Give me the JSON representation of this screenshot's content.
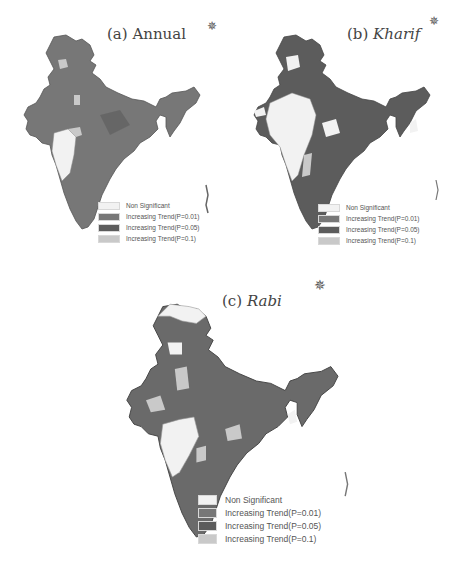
{
  "colors": {
    "non_significant": "#f2f2f2",
    "p001": "#777777",
    "p005": "#5c5c5c",
    "p01": "#c9c9c9",
    "border": "#4a4a4a"
  },
  "panels": [
    {
      "id": "a",
      "label_prefix": "(a) ",
      "label_name": "Annual",
      "italic": false
    },
    {
      "id": "b",
      "label_prefix": "(b) ",
      "label_name": "Kharif",
      "italic": true
    },
    {
      "id": "c",
      "label_prefix": "(c) ",
      "label_name": "Rabi",
      "italic": true
    }
  ],
  "legend": {
    "items": [
      {
        "label": "Non Significant",
        "key": "non_significant"
      },
      {
        "label": "Increasing Trend(P=0.01)",
        "key": "p001"
      },
      {
        "label": "Increasing Trend(P=0.05)",
        "key": "p005"
      },
      {
        "label": "Increasing Trend(P=0.1)",
        "key": "p01"
      }
    ]
  },
  "compass_icon": "✵"
}
